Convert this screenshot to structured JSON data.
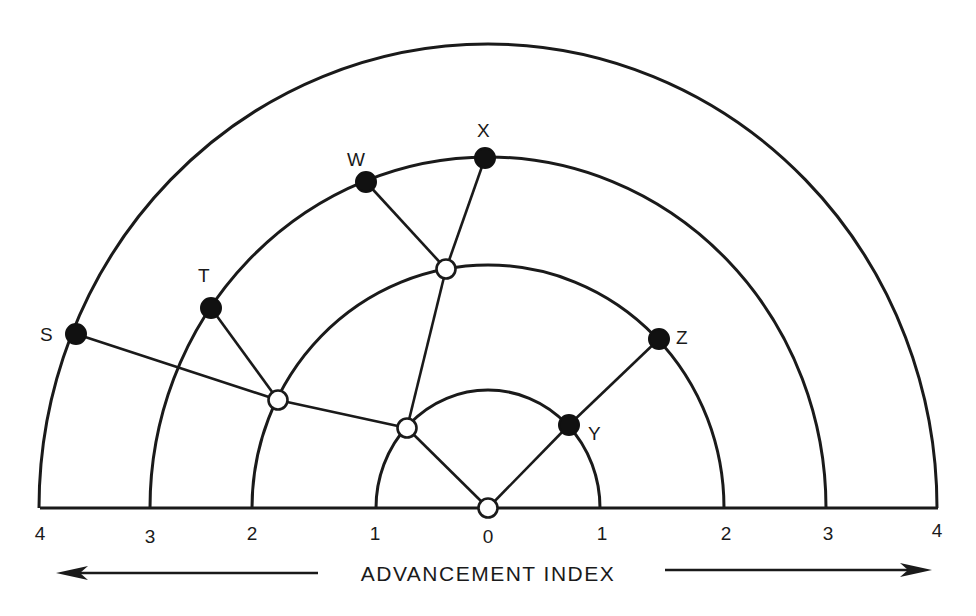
{
  "diagram": {
    "axis_title": "ADVANCEMENT INDEX",
    "center": {
      "x": 488,
      "y": 508
    },
    "rings": [
      {
        "index": 1,
        "rx": 112,
        "ry": 118
      },
      {
        "index": 2,
        "rx": 236,
        "ry": 243
      },
      {
        "index": 3,
        "rx": 338,
        "ry": 351
      },
      {
        "index": 4,
        "rx": 449,
        "ry": 464
      }
    ],
    "tick_labels": [
      {
        "label": "4",
        "x": 40,
        "y": 540
      },
      {
        "label": "3",
        "x": 150,
        "y": 543
      },
      {
        "label": "2",
        "x": 252,
        "y": 540
      },
      {
        "label": "1",
        "x": 375,
        "y": 540
      },
      {
        "label": "0",
        "x": 488,
        "y": 543
      },
      {
        "label": "1",
        "x": 602,
        "y": 540
      },
      {
        "label": "2",
        "x": 726,
        "y": 540
      },
      {
        "label": "3",
        "x": 828,
        "y": 540
      },
      {
        "label": "4",
        "x": 937,
        "y": 537
      }
    ],
    "nodes": [
      {
        "id": "root",
        "type": "open",
        "x": 488,
        "y": 508,
        "label": ""
      },
      {
        "id": "n1",
        "type": "open",
        "x": 407,
        "y": 428,
        "label": ""
      },
      {
        "id": "n2",
        "type": "open",
        "x": 278,
        "y": 400,
        "label": ""
      },
      {
        "id": "n3",
        "type": "open",
        "x": 446,
        "y": 269,
        "label": ""
      },
      {
        "id": "S",
        "type": "filled",
        "x": 76,
        "y": 334,
        "label": "S"
      },
      {
        "id": "T",
        "type": "filled",
        "x": 211,
        "y": 308,
        "label": "T"
      },
      {
        "id": "W",
        "type": "filled",
        "x": 366,
        "y": 182,
        "label": "W"
      },
      {
        "id": "X",
        "type": "filled",
        "x": 485,
        "y": 158,
        "label": "X"
      },
      {
        "id": "Y",
        "type": "filled",
        "x": 569,
        "y": 425,
        "label": "Y"
      },
      {
        "id": "Z",
        "type": "filled",
        "x": 659,
        "y": 339,
        "label": "Z"
      }
    ],
    "edges": [
      [
        "root",
        "n1"
      ],
      [
        "n1",
        "n2"
      ],
      [
        "n1",
        "n3"
      ],
      [
        "n2",
        "S"
      ],
      [
        "n2",
        "T"
      ],
      [
        "n3",
        "W"
      ],
      [
        "n3",
        "X"
      ],
      [
        "root",
        "Y"
      ],
      [
        "Y",
        "Z"
      ]
    ],
    "labels": {
      "S": {
        "x": 40,
        "y": 341
      },
      "T": {
        "x": 198,
        "y": 282
      },
      "W": {
        "x": 347,
        "y": 166
      },
      "X": {
        "x": 477,
        "y": 137
      },
      "Y": {
        "x": 588,
        "y": 440
      },
      "Z": {
        "x": 676,
        "y": 344
      }
    }
  }
}
